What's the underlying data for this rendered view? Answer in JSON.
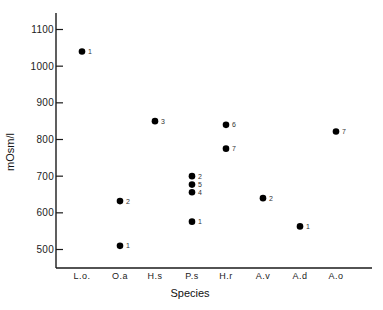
{
  "chart_data": {
    "type": "scatter",
    "title": "",
    "xlabel": "Species",
    "ylabel": "mOsm/l",
    "categories": [
      "L.o.",
      "O.a",
      "H.s",
      "P.s",
      "H.r",
      "A.v",
      "A.d",
      "A.o"
    ],
    "yticks": [
      500,
      600,
      700,
      800,
      900,
      1000,
      1100
    ],
    "ylim": [
      450,
      1170
    ],
    "grid": false,
    "legend": null,
    "points": [
      {
        "category": "L.o.",
        "y": 1040,
        "label": "1"
      },
      {
        "category": "O.a",
        "y": 632,
        "label": "2"
      },
      {
        "category": "O.a",
        "y": 510,
        "label": "1"
      },
      {
        "category": "H.s",
        "y": 850,
        "label": "3"
      },
      {
        "category": "P.s",
        "y": 700,
        "label": "2"
      },
      {
        "category": "P.s",
        "y": 677,
        "label": "5"
      },
      {
        "category": "P.s",
        "y": 656,
        "label": "4"
      },
      {
        "category": "P.s",
        "y": 576,
        "label": "1"
      },
      {
        "category": "H.r",
        "y": 840,
        "label": "6"
      },
      {
        "category": "H.r",
        "y": 775,
        "label": "7"
      },
      {
        "category": "A.v",
        "y": 640,
        "label": "2"
      },
      {
        "category": "A.d",
        "y": 563,
        "label": "1"
      },
      {
        "category": "A.o",
        "y": 822,
        "label": "7"
      }
    ]
  },
  "colors": {
    "axis": "#1a1a1a",
    "marker": "#000000",
    "background": "#ffffff"
  }
}
